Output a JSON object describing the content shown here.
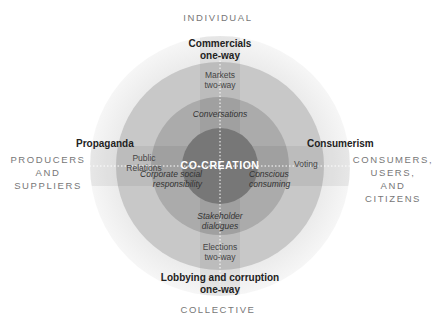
{
  "axes": {
    "top": "INDIVIDUAL",
    "bottom": "COLLECTIVE",
    "left": [
      "PRODUCERS",
      "AND",
      "SUPPLIERS"
    ],
    "right": [
      "CONSUMERS,",
      "USERS,",
      "AND",
      "CITIZENS"
    ]
  },
  "outer_labels": {
    "top": [
      "Commercials",
      "one-way"
    ],
    "bottom": [
      "Lobbying and corruption",
      "one-way"
    ],
    "left": "Propaganda",
    "right": "Consumerism"
  },
  "middle_labels": {
    "top": [
      "Markets",
      "two-way"
    ],
    "bottom": [
      "Elections",
      "two-way"
    ],
    "left": [
      "Public",
      "Relations"
    ],
    "right": "Voting"
  },
  "inner_labels": {
    "top": "Conversations",
    "bottom": [
      "Stakeholder",
      "dialogues"
    ],
    "left": [
      "Corporate social",
      "responsibility"
    ],
    "right": [
      "Conscious",
      "consuming"
    ]
  },
  "center": "CO-CREATION",
  "colors": {
    "outer_ring": "#ededed",
    "middle_ring": "#c9c9c9",
    "inner_ring": "#a9a9a9",
    "core": "#7a7a7a",
    "band_overlay": "#000000"
  }
}
